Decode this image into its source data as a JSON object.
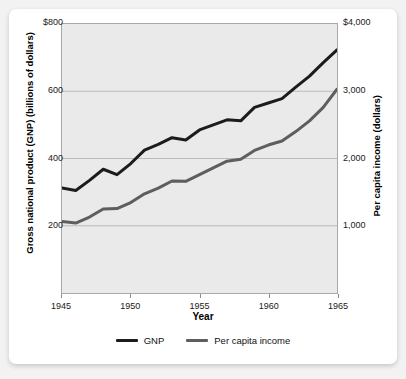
{
  "card": {
    "background": "#ffffff",
    "page_background": "#f2f2f2"
  },
  "chart_data": {
    "type": "line",
    "title": "",
    "xlabel": "Year",
    "ylabel": "Gross national product (GNP) (billions of dollars)",
    "y2label": "Per capita income (dollars)",
    "grid": true,
    "legend_position": "bottom",
    "plot_background": "#eaeaea",
    "xlim": [
      1945,
      1965
    ],
    "ylim": [
      0,
      800
    ],
    "y2lim": [
      0,
      4000
    ],
    "x_ticks": [
      1945,
      1950,
      1955,
      1960,
      1965
    ],
    "x_tick_labels": [
      "1945",
      "1950",
      "1955",
      "1960",
      "1965"
    ],
    "y_ticks": [
      200,
      400,
      600,
      800
    ],
    "y_tick_labels": [
      "200",
      "400",
      "600",
      "$800"
    ],
    "y2_ticks": [
      1000,
      2000,
      3000,
      4000
    ],
    "y2_tick_labels": [
      "1,000",
      "2,000",
      "3,000",
      "$4,000"
    ],
    "x": [
      1945,
      1946,
      1947,
      1948,
      1949,
      1950,
      1951,
      1952,
      1953,
      1954,
      1955,
      1956,
      1957,
      1958,
      1959,
      1960,
      1961,
      1962,
      1963,
      1964,
      1965
    ],
    "series": [
      {
        "name": "GNP",
        "color": "#1c1c1c",
        "axis": "left",
        "units": "billions of dollars",
        "values": [
          312,
          305,
          335,
          368,
          352,
          385,
          425,
          442,
          462,
          455,
          485,
          500,
          515,
          512,
          552,
          565,
          578,
          612,
          645,
          685,
          723
        ]
      },
      {
        "name": "Per capita income",
        "color": "#5e5e5e",
        "axis": "right",
        "units": "dollars",
        "values": [
          1065,
          1040,
          1130,
          1250,
          1255,
          1345,
          1475,
          1560,
          1665,
          1660,
          1760,
          1860,
          1960,
          1990,
          2120,
          2200,
          2260,
          2400,
          2560,
          2760,
          3030
        ]
      }
    ]
  },
  "legend": {
    "items": [
      {
        "label": "GNP",
        "color": "#1c1c1c"
      },
      {
        "label": "Per capita income",
        "color": "#5e5e5e"
      }
    ]
  }
}
